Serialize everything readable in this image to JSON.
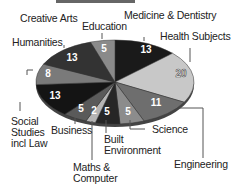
{
  "chart_data": {
    "type": "pie",
    "title": "",
    "style": "3d-ellipse",
    "slices": [
      {
        "label": "Medicine & Dentistry",
        "value": 13,
        "color": "#1a1a1a"
      },
      {
        "label": "Health Subjects",
        "value": 20,
        "color": "#c8c8c8"
      },
      {
        "label": "Engineering",
        "value": 11,
        "color": "#6e6e6e"
      },
      {
        "label": "Science",
        "value": 5,
        "color": "#8c8c8c"
      },
      {
        "label": "Built Environment",
        "value": 5,
        "color": "#262626"
      },
      {
        "label": "Maths & Computer",
        "value": 2,
        "color": "#b4b4b4"
      },
      {
        "label": "Business",
        "value": 5,
        "color": "#5a5a5a"
      },
      {
        "label": "Social Studies incl Law",
        "value": 13,
        "color": "#141414"
      },
      {
        "label": "Humanities",
        "value": 8,
        "color": "#7a7a7a"
      },
      {
        "label": "Creative Arts",
        "value": 13,
        "color": "#333333"
      },
      {
        "label": "Education",
        "value": 5,
        "color": "#8a8a8a"
      }
    ]
  },
  "labels": {
    "medicine": "Medicine & Dentistry",
    "health": "Health Subjects",
    "engineering": "Engineering",
    "science": "Science",
    "built1": "Built",
    "built2": "Environment",
    "maths1": "Maths &",
    "maths2": "Computer",
    "business": "Business",
    "social1": "Social",
    "social2": "Studies",
    "social3": "incl Law",
    "humanities": "Humanities",
    "creative": "Creative Arts",
    "education": "Education"
  },
  "values": {
    "medicine": "13",
    "health": "20",
    "engineering": "11",
    "science": "5",
    "built": "5",
    "maths": "2",
    "business": "5",
    "social": "13",
    "humanities": "8",
    "creative": "13",
    "education": "5"
  }
}
